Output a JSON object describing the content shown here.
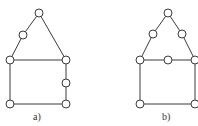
{
  "diagrams": [
    {
      "label": "a)",
      "nodes": [
        {
          "id": "apex",
          "x": 39,
          "y": 13
        },
        {
          "id": "left-roof-mid",
          "x": 23,
          "y": 35
        },
        {
          "id": "top-left",
          "x": 10,
          "y": 60
        },
        {
          "id": "top-right",
          "x": 66,
          "y": 60
        },
        {
          "id": "right-wall-mid",
          "x": 66,
          "y": 83
        },
        {
          "id": "bottom-left",
          "x": 10,
          "y": 104
        },
        {
          "id": "bottom-right",
          "x": 66,
          "y": 104
        }
      ],
      "edges": [
        [
          "apex",
          "left-roof-mid"
        ],
        [
          "left-roof-mid",
          "top-left"
        ],
        [
          "apex",
          "top-right"
        ],
        [
          "top-left",
          "top-right"
        ],
        [
          "top-left",
          "bottom-left"
        ],
        [
          "top-right",
          "right-wall-mid"
        ],
        [
          "right-wall-mid",
          "bottom-right"
        ],
        [
          "bottom-left",
          "bottom-right"
        ]
      ]
    },
    {
      "label": "b)",
      "nodes": [
        {
          "id": "apex",
          "x": 168,
          "y": 13
        },
        {
          "id": "left-roof-mid",
          "x": 153,
          "y": 34
        },
        {
          "id": "right-roof-mid",
          "x": 182,
          "y": 34
        },
        {
          "id": "top-left",
          "x": 140,
          "y": 60
        },
        {
          "id": "top-mid",
          "x": 168,
          "y": 60
        },
        {
          "id": "top-right",
          "x": 195,
          "y": 60
        },
        {
          "id": "bottom-left",
          "x": 140,
          "y": 104
        },
        {
          "id": "bottom-right",
          "x": 195,
          "y": 104
        }
      ],
      "edges": [
        [
          "apex",
          "left-roof-mid"
        ],
        [
          "left-roof-mid",
          "top-left"
        ],
        [
          "apex",
          "right-roof-mid"
        ],
        [
          "right-roof-mid",
          "top-right"
        ],
        [
          "top-left",
          "top-mid"
        ],
        [
          "top-mid",
          "top-right"
        ],
        [
          "top-left",
          "bottom-left"
        ],
        [
          "top-right",
          "bottom-right"
        ],
        [
          "bottom-left",
          "bottom-right"
        ]
      ]
    }
  ],
  "style": {
    "node_radius": 4,
    "stroke_color": "#3a3a3a"
  }
}
